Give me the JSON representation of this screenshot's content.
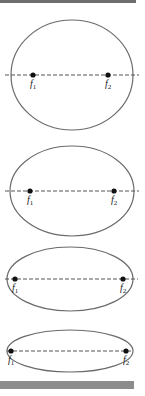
{
  "figure": {
    "stroke_color": "#6a6a6a",
    "focus_color": "#111111",
    "axis_color": "#555555",
    "bar_colors": {
      "top": "#6e6e6e",
      "bottom": "#8c8c8c"
    },
    "ellipses": [
      {
        "id": 1,
        "cx": 72,
        "cy": 75,
        "rx": 61,
        "ry": 55,
        "f1_x": 33,
        "f2_x": 108,
        "axis_x1": 5,
        "axis_x2": 139,
        "focus1": {
          "label": "f",
          "sub": "1"
        },
        "focus2": {
          "label": "f",
          "sub": "2"
        }
      },
      {
        "id": 2,
        "cx": 72,
        "cy": 191,
        "rx": 62,
        "ry": 45,
        "f1_x": 30,
        "f2_x": 114,
        "axis_x1": 5,
        "axis_x2": 139,
        "focus1": {
          "label": "f",
          "sub": "1"
        },
        "focus2": {
          "label": "f",
          "sub": "2"
        }
      },
      {
        "id": 3,
        "cx": 70,
        "cy": 279,
        "rx": 63,
        "ry": 32,
        "f1_x": 15,
        "f2_x": 123,
        "axis_x1": 5,
        "axis_x2": 138,
        "focus1": {
          "label": "f",
          "sub": "1"
        },
        "focus2": {
          "label": "f",
          "sub": "2"
        }
      },
      {
        "id": 4,
        "cx": 70,
        "cy": 351,
        "rx": 63,
        "ry": 21,
        "f1_x": 11,
        "f2_x": 126,
        "axis_x1": 7,
        "axis_x2": 133,
        "focus1": {
          "label": "f",
          "sub": "1"
        },
        "focus2": {
          "label": "f",
          "sub": "2"
        }
      }
    ]
  }
}
